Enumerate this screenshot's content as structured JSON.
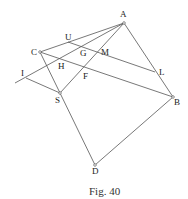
{
  "figure": {
    "caption": "Fig. 40",
    "points": {
      "A": {
        "label": "A",
        "x": 124,
        "y": 23
      },
      "C": {
        "label": "C",
        "x": 40,
        "y": 52
      },
      "S": {
        "label": "S",
        "x": 60,
        "y": 93
      },
      "B": {
        "label": "B",
        "x": 173,
        "y": 97
      },
      "D": {
        "label": "D",
        "x": 95,
        "y": 165
      },
      "L": {
        "label": "L",
        "x": 155,
        "y": 72
      },
      "U": {
        "label": "U",
        "x": 68,
        "y": 42
      },
      "M": {
        "label": "M",
        "x": 97,
        "y": 51
      },
      "G": {
        "label": "G",
        "x": 82,
        "y": 53
      },
      "H": {
        "label": "H",
        "x": 60,
        "y": 64
      },
      "F": {
        "label": "F",
        "x": 84,
        "y": 74
      },
      "I": {
        "label": "I",
        "x": 26,
        "y": 78
      }
    },
    "segments": [
      "A-C",
      "A-S",
      "A-B",
      "A-I extended",
      "C-S",
      "C-B",
      "U-L",
      "I-S",
      "S-D",
      "D-B"
    ]
  }
}
